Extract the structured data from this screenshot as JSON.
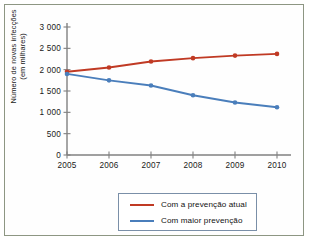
{
  "chart_data": {
    "type": "line",
    "title": "",
    "xlabel": "",
    "ylabel": "Número de novas infecções\n(em milhares)",
    "x": [
      2005,
      2006,
      2007,
      2008,
      2009,
      2010
    ],
    "xtick_labels": [
      "2005",
      "2006",
      "2007",
      "2008",
      "2009",
      "2010"
    ],
    "ytick_values": [
      0,
      500,
      1000,
      1500,
      2000,
      2500,
      3000
    ],
    "ytick_labels": [
      "0",
      "500",
      "1 000",
      "1 500",
      "2 000",
      "2 500",
      "3 000"
    ],
    "ylim": [
      0,
      3000
    ],
    "xlim": [
      2005,
      2010
    ],
    "grid": false,
    "legend_position": "below-plot",
    "series": [
      {
        "name": "Com a prevenção atual",
        "color": "#c03a24",
        "values": [
          1950,
          2050,
          2190,
          2270,
          2330,
          2370
        ]
      },
      {
        "name": "Com maior prevenção",
        "color": "#4a7ebb",
        "values": [
          1900,
          1750,
          1630,
          1400,
          1230,
          1120
        ]
      }
    ]
  },
  "frame": {
    "border_color": "#8d9683",
    "background_color": "#fefefe"
  },
  "legend": {
    "border_color": "#7a8fa8",
    "entries": [
      {
        "label": "Com a prevenção atual",
        "color": "#c03a24"
      },
      {
        "label": "Com maior prevenção",
        "color": "#4a7ebb"
      }
    ]
  }
}
